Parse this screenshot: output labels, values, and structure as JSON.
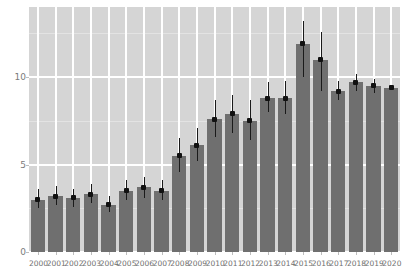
{
  "chart_data": {
    "type": "bar",
    "title": "",
    "subtitle": "",
    "xlabel": "",
    "ylabel": "",
    "categories": [
      "2000",
      "2001",
      "2002",
      "2003",
      "2004",
      "2005",
      "2006",
      "2007",
      "2008",
      "2009",
      "2010",
      "2011",
      "2012",
      "2013",
      "2014",
      "2015",
      "2016",
      "2017",
      "2018",
      "2019",
      "2020"
    ],
    "values": [
      3.0,
      3.2,
      3.1,
      3.3,
      2.7,
      3.5,
      3.7,
      3.5,
      5.5,
      6.1,
      7.6,
      7.9,
      7.5,
      8.8,
      8.8,
      11.9,
      11.0,
      9.2,
      9.7,
      9.5,
      9.4
    ],
    "error_low": [
      2.5,
      2.7,
      2.6,
      2.8,
      2.3,
      3.0,
      3.1,
      3.0,
      4.6,
      5.2,
      6.6,
      6.8,
      6.4,
      8.0,
      7.9,
      10.0,
      9.2,
      8.7,
      9.2,
      9.1,
      9.4
    ],
    "error_high": [
      3.6,
      3.8,
      3.6,
      3.9,
      3.2,
      4.1,
      4.3,
      4.1,
      6.5,
      7.1,
      8.7,
      9.0,
      8.7,
      9.7,
      9.8,
      13.2,
      12.6,
      9.8,
      10.2,
      9.9,
      9.4
    ],
    "ylim": [
      0,
      14
    ],
    "yticks": [
      0,
      5,
      10
    ],
    "ytick_labels": [
      "0",
      "5",
      "10"
    ],
    "grid": true,
    "legend": "none",
    "colors": {
      "bar": "#6f6f6f",
      "panel_background": "#d5d5d5",
      "gridline": "#ffffff",
      "error_bar": "#1a1a1a",
      "marker": "#111111",
      "tick_label": "#6f6f6f",
      "figure_background": "#ffffff"
    }
  }
}
